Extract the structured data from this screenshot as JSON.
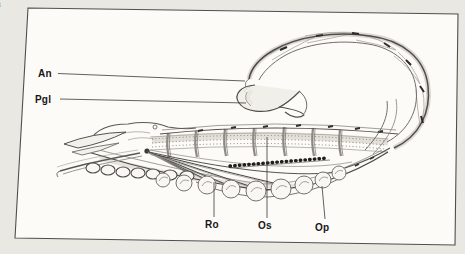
{
  "page": {
    "kind": "scanned-book-figure",
    "colors": {
      "paper": "#eae8e3",
      "figure_background": "#fcfbf7",
      "frame": "#4f4f4f",
      "label_ink": "#161616",
      "drawing_ink": "#504e4a"
    }
  },
  "figure": {
    "illustration": "scorpion-sagittal-section-drawing",
    "labels": [
      {
        "id": "an",
        "text": "An"
      },
      {
        "id": "pgl",
        "text": "Pgl"
      },
      {
        "id": "ro",
        "text": "Ro"
      },
      {
        "id": "os",
        "text": "Os"
      },
      {
        "id": "op",
        "text": "Op"
      }
    ]
  },
  "edge_fragments": [
    "n",
    "r",
    "e",
    "l",
    "r",
    "."
  ]
}
